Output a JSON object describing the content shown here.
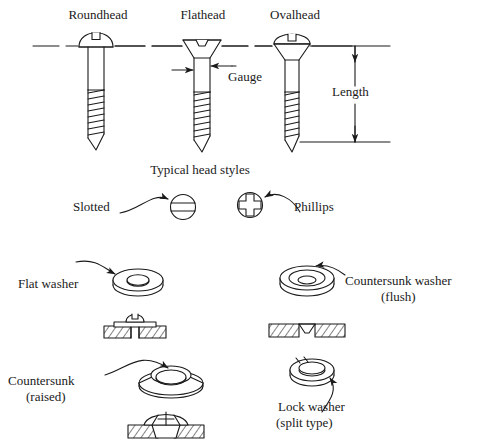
{
  "diagram": {
    "stroke_color": "#1a1a1a",
    "background_color": "#ffffff"
  },
  "screws": {
    "roundhead": {
      "label": "Roundhead",
      "head_style": "dome with slot"
    },
    "flathead": {
      "label": "Flathead",
      "head_style": "flat top, conical underside, slotted"
    },
    "ovalhead": {
      "label": "Ovalhead",
      "head_style": "oval dome over conical taper, slotted"
    }
  },
  "dimensions": {
    "gauge": {
      "label": "Gauge",
      "meaning": "shank diameter"
    },
    "length": {
      "label": "Length",
      "meaning": "overall length below head line"
    }
  },
  "head_styles": {
    "heading": "Typical head styles",
    "slotted": {
      "label": "Slotted",
      "drive": "single slot"
    },
    "phillips": {
      "label": "Phillips",
      "drive": "cross"
    }
  },
  "washers": {
    "flat": {
      "label": "Flat washer"
    },
    "countersunk_flush": {
      "label_line1": "Countersunk washer",
      "label_line2": "(flush)"
    },
    "countersunk_raised": {
      "label_line1": "Countersunk",
      "label_line2": "(raised)"
    },
    "lock": {
      "label_line1": "Lock washer",
      "label_line2": "(split type)"
    }
  }
}
